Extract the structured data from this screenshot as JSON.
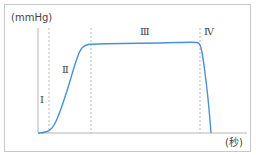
{
  "chart_data": {
    "type": "line",
    "title": "",
    "ylabel": "(mmHg)",
    "xlabel": "(秒)",
    "phase_labels": [
      "Ⅰ",
      "Ⅱ",
      "Ⅲ",
      "Ⅳ"
    ],
    "phase_boundaries_px_x": [
      49,
      91,
      200
    ],
    "series": [
      {
        "name": "pressure",
        "color": "#4a90d9",
        "points_px": [
          [
            38,
            133
          ],
          [
            44,
            132.5
          ],
          [
            49,
            131
          ],
          [
            54,
            126
          ],
          [
            60,
            112
          ],
          [
            68,
            88
          ],
          [
            75,
            64
          ],
          [
            80,
            50
          ],
          [
            85,
            45
          ],
          [
            91,
            44
          ],
          [
            120,
            43.5
          ],
          [
            160,
            43
          ],
          [
            195,
            42
          ],
          [
            199,
            43
          ],
          [
            201,
            47
          ],
          [
            203,
            58
          ],
          [
            206,
            80
          ],
          [
            209,
            108
          ],
          [
            211,
            133
          ]
        ]
      }
    ],
    "grid": false,
    "axis_color": "#b5b5b5",
    "dash_color": "#a8a8a8",
    "line_color": "#4a90d9"
  },
  "labels": {
    "y_unit": "(mmHg)",
    "x_unit": "(秒)",
    "phase1": "Ⅰ",
    "phase2": "Ⅱ",
    "phase3": "Ⅲ",
    "phase4": "Ⅳ"
  }
}
